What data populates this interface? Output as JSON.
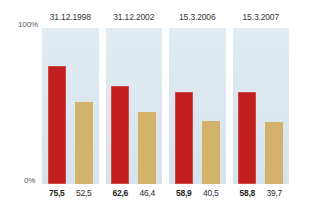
{
  "axis": {
    "top_label": "100%",
    "bottom_label": "0%"
  },
  "colors": {
    "primary_bar": "#c2201f",
    "secondary_bar": "#d3b36c",
    "panel_background": "#dde7ef",
    "page_background": "#ffffff",
    "text": "#1d1f22"
  },
  "groups": [
    {
      "title": "31.12.1998",
      "primary_value": "75,5",
      "secondary_value": "52,5"
    },
    {
      "title": "31.12.2002",
      "primary_value": "62,6",
      "secondary_value": "46,4"
    },
    {
      "title": "15.3.2006",
      "primary_value": "58,9",
      "secondary_value": "40,5"
    },
    {
      "title": "15.3.2007",
      "primary_value": "58,8",
      "secondary_value": "39,7"
    }
  ],
  "chart_data": {
    "type": "bar",
    "title": "",
    "xlabel": "",
    "ylabel": "",
    "ylim": [
      0,
      100
    ],
    "grid": false,
    "legend": "none",
    "ytick_labels": [
      "0%",
      "100%"
    ],
    "categories": [
      "31.12.1998",
      "31.12.2002",
      "15.3.2006",
      "15.3.2007"
    ],
    "series": [
      {
        "name": "primary",
        "color": "#c2201f",
        "values": [
          75.5,
          62.6,
          58.9,
          58.8
        ],
        "value_labels": [
          "75,5",
          "62,6",
          "58,9",
          "58,8"
        ]
      },
      {
        "name": "secondary",
        "color": "#d3b36c",
        "values": [
          52.5,
          46.4,
          40.5,
          39.7
        ],
        "value_labels": [
          "52,5",
          "46,4",
          "40,5",
          "39,7"
        ]
      }
    ]
  }
}
